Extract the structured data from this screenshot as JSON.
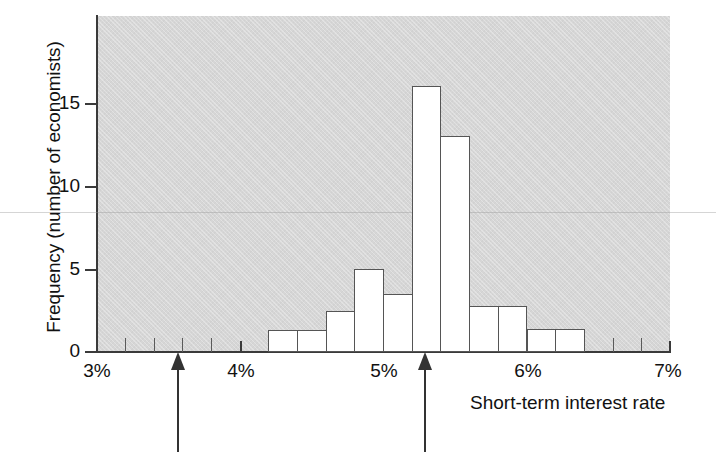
{
  "chart_data": {
    "type": "bar",
    "title": "",
    "subtitle": "",
    "xlabel": "Short-term interest rate",
    "ylabel": "Frequency (number of economists)",
    "xlim": [
      3,
      7
    ],
    "ylim": [
      0,
      19
    ],
    "grid": false,
    "legend": null,
    "bin_width": 0.2,
    "x_unit": "%",
    "x_tick_labels": [
      "3%",
      "4%",
      "5%",
      "6%",
      "7%"
    ],
    "x_tick_values": [
      3,
      4,
      5,
      6,
      7
    ],
    "x_minor_tick_values": [
      3.2,
      3.4,
      3.6,
      3.8,
      4.2,
      4.4,
      4.6,
      4.8,
      5.2,
      5.4,
      5.6,
      5.8,
      6.2,
      6.4,
      6.6,
      6.8
    ],
    "y_tick_labels": [
      "0",
      "5",
      "10",
      "15"
    ],
    "y_tick_values": [
      0,
      5,
      10,
      15
    ],
    "bins": [
      {
        "x0": 4.2,
        "x1": 4.4,
        "value": 1.3
      },
      {
        "x0": 4.4,
        "x1": 4.6,
        "value": 1.3
      },
      {
        "x0": 4.6,
        "x1": 4.8,
        "value": 2.5
      },
      {
        "x0": 4.8,
        "x1": 5.0,
        "value": 5.0
      },
      {
        "x0": 5.0,
        "x1": 5.2,
        "value": 3.5
      },
      {
        "x0": 5.2,
        "x1": 5.4,
        "value": 16.0
      },
      {
        "x0": 5.4,
        "x1": 5.6,
        "value": 13.0
      },
      {
        "x0": 5.6,
        "x1": 5.8,
        "value": 2.8
      },
      {
        "x0": 5.8,
        "x1": 6.0,
        "value": 2.8
      },
      {
        "x0": 6.0,
        "x1": 6.2,
        "value": 1.4
      },
      {
        "x0": 6.2,
        "x1": 6.4,
        "value": 1.4
      }
    ],
    "categories": [
      "4.2-4.4%",
      "4.4-4.6%",
      "4.6-4.8%",
      "4.8-5.0%",
      "5.0-5.2%",
      "5.2-5.4%",
      "5.4-5.6%",
      "5.6-5.8%",
      "5.8-6.0%",
      "6.0-6.2%",
      "6.2-6.4%"
    ],
    "values": [
      1.3,
      1.3,
      2.5,
      5,
      3.5,
      16,
      13,
      2.8,
      2.8,
      1.4,
      1.4
    ],
    "annotations": [
      {
        "name": "arrow-marker-low",
        "x": 3.57,
        "direction": "up"
      },
      {
        "name": "arrow-marker-high",
        "x": 5.29,
        "direction": "up"
      }
    ],
    "colors": {
      "plot_background": "#d6d6d6",
      "bar_fill": "#ffffff",
      "bar_edge": "#555555",
      "axis": "#3a3a3a",
      "text": "#111111",
      "arrow": "#333333"
    }
  }
}
